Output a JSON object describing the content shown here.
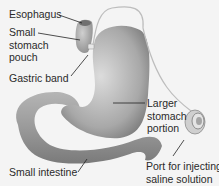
{
  "diagram": {
    "labels": {
      "esophagus": "Esophagus",
      "small_pouch": "Small\nstomach\npouch",
      "gastric_band": "Gastric band",
      "larger_portion": "Larger\nstomach\nportion",
      "port": "Port for injecting\nsaline solution",
      "small_intestine": "Small intestine"
    },
    "colors": {
      "background": "#f4f4f4",
      "organ_light": "#d8d8d8",
      "organ_dark": "#8a8a8a",
      "text": "#2a2a2a",
      "leader_line": "#222222"
    }
  }
}
